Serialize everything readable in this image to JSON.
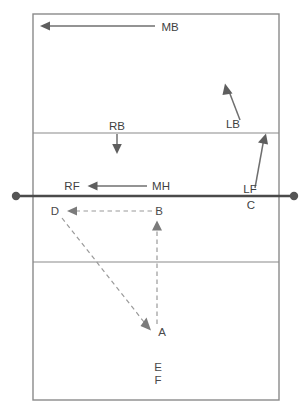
{
  "diagram": {
    "court": {
      "outline": {
        "x": 33,
        "y": 14,
        "width": 246,
        "height": 386
      },
      "attack_line_far_y": 133,
      "attack_line_near_y": 262,
      "net_y": 196,
      "net_x_start": 16,
      "net_x_end": 294,
      "line_color": "#8a8a8a",
      "net_color": "#4a4a4a",
      "background_color": "#ffffff"
    },
    "antennas": [
      {
        "name": "left-antenna-dot",
        "cx": 16,
        "cy": 196,
        "r": 4.2
      },
      {
        "name": "right-antenna-dot",
        "cx": 294,
        "cy": 196,
        "r": 4.2
      }
    ],
    "player_movements": [
      {
        "id": "MB",
        "label": "MB",
        "description": "middle back moves left along back line",
        "label_x": 170,
        "label_y": 31,
        "line": {
          "x1": 155,
          "y1": 26,
          "x2": 46,
          "y2": 26
        },
        "head": {
          "x": 40,
          "y": 26,
          "angle": 180
        },
        "style": "solid"
      },
      {
        "id": "LB",
        "label": "LB",
        "description": "left back moves diagonally up and left",
        "label_x": 233,
        "label_y": 128,
        "line": {
          "x1": 240,
          "y1": 120,
          "x2": 228,
          "y2": 90
        },
        "head": {
          "x": 225,
          "y": 84,
          "angle": -68
        },
        "style": "solid"
      },
      {
        "id": "RB",
        "label": "RB",
        "description": "right back moves straight down",
        "label_x": 117,
        "label_y": 130,
        "line": {
          "x1": 117,
          "y1": 134,
          "x2": 117,
          "y2": 147
        },
        "head": {
          "x": 117,
          "y": 153,
          "angle": 90
        },
        "style": "solid"
      },
      {
        "id": "RF",
        "label": "RF",
        "description": "right front target position",
        "label_x": 72,
        "label_y": 190,
        "style": "label-only"
      },
      {
        "id": "MH",
        "label": "MH",
        "description": "middle hitter moves left toward right front",
        "label_x": 161,
        "label_y": 190,
        "line": {
          "x1": 147,
          "y1": 186,
          "x2": 94,
          "y2": 186
        },
        "head": {
          "x": 88,
          "y": 186,
          "angle": 180
        },
        "style": "solid"
      },
      {
        "id": "LF",
        "label": "LF",
        "description": "left front moves up and left to attack line",
        "label_x": 250,
        "label_y": 193,
        "line": {
          "x1": 255,
          "y1": 188,
          "x2": 264,
          "y2": 141
        },
        "head": {
          "x": 266,
          "y": 134,
          "angle": -79
        },
        "style": "solid"
      },
      {
        "id": "C",
        "label": "C",
        "description": "center marker below net on right side",
        "label_x": 251,
        "label_y": 209,
        "style": "label-only"
      }
    ],
    "ball_path_points": [
      {
        "id": "A",
        "label": "A",
        "label_x": 160,
        "label_y": 336,
        "x": 155,
        "y": 330
      },
      {
        "id": "B",
        "label": "B",
        "label_x": 157,
        "label_y": 215,
        "x": 157,
        "y": 218
      },
      {
        "id": "D",
        "label": "D",
        "label_x": 55,
        "label_y": 215,
        "x": 66,
        "y": 211
      },
      {
        "id": "E",
        "label": "E",
        "label_x": 157,
        "label_y": 371
      },
      {
        "id": "F",
        "label": "F",
        "label_x": 157,
        "label_y": 384
      }
    ],
    "ball_paths": [
      {
        "id": "B-to-D",
        "from": "B",
        "to": "D",
        "description": "dashed pass from B leftward to D",
        "line": {
          "x1": 153,
          "y1": 211,
          "x2": 74,
          "y2": 211
        },
        "head": {
          "x": 67,
          "y": 211,
          "angle": 180
        },
        "style": "dashed"
      },
      {
        "id": "A-to-B",
        "from": "A",
        "to": "B",
        "description": "dashed set from A upward to B",
        "line": {
          "x1": 157,
          "y1": 325,
          "x2": 157,
          "y2": 228
        },
        "head": {
          "x": 157,
          "y": 221,
          "angle": -90
        },
        "style": "dashed"
      },
      {
        "id": "D-to-A",
        "from": "D",
        "to": "A",
        "description": "dashed diagonal run from D down to A",
        "line": {
          "x1": 62,
          "y1": 218,
          "x2": 145,
          "y2": 323
        },
        "head": {
          "x": 151,
          "y": 330,
          "angle": 52
        },
        "style": "dashed"
      }
    ]
  }
}
